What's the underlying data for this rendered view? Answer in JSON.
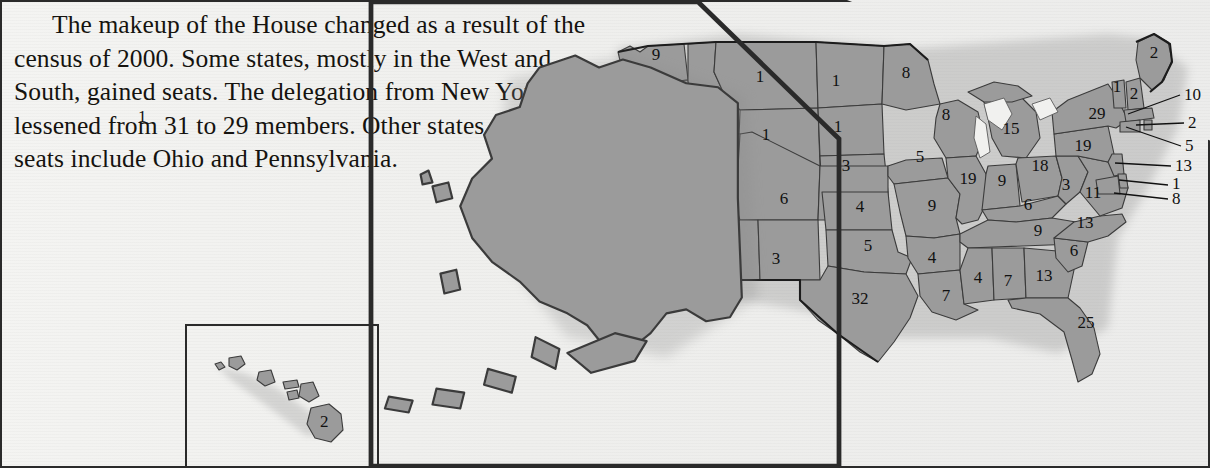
{
  "caption": {
    "text": "The makeup of the House changed as a result of the census of 2000. Some states, mostly in the West and South, gained seats. The delegation from New York lessened from 31 to 29 members. Other states that lost seats include Ohio and Pennsylvania."
  },
  "colors": {
    "land_fill": "#9b9b9b",
    "land_stroke": "#3b3b3b",
    "coast_stroke": "#1c1c1c",
    "page_background": "#f1f1ef",
    "text": "#15130f"
  },
  "map": {
    "title": "U.S. House seats by state after the 2000 census",
    "inset_hawaii_label": "2",
    "inset_alaska_label": "1",
    "ghost_text": "bleed-through",
    "states": [
      {
        "code": "WA",
        "seats": "9",
        "x": 68,
        "y": 52
      },
      {
        "code": "OR",
        "seats": "5",
        "x": 44,
        "y": 98
      },
      {
        "code": "ID",
        "seats": "2",
        "x": 110,
        "y": 113
      },
      {
        "code": "MT",
        "seats": "1",
        "x": 172,
        "y": 74
      },
      {
        "code": "WY",
        "seats": "1",
        "x": 178,
        "y": 132
      },
      {
        "code": "ND",
        "seats": "1",
        "x": 248,
        "y": 78
      },
      {
        "code": "SD",
        "seats": "1",
        "x": 250,
        "y": 124
      },
      {
        "code": "NE",
        "seats": "3",
        "x": 258,
        "y": 163
      },
      {
        "code": "CA",
        "seats": "52",
        "x": 36,
        "y": 199
      },
      {
        "code": "NV",
        "seats": "3",
        "x": 82,
        "y": 172
      },
      {
        "code": "UT",
        "seats": "3",
        "x": 134,
        "y": 185
      },
      {
        "code": "CO",
        "seats": "6",
        "x": 196,
        "y": 196
      },
      {
        "code": "KS",
        "seats": "4",
        "x": 272,
        "y": 204
      },
      {
        "code": "AZ",
        "seats": "8",
        "x": 126,
        "y": 248
      },
      {
        "code": "NM",
        "seats": "3",
        "x": 188,
        "y": 256
      },
      {
        "code": "OK",
        "seats": "5",
        "x": 280,
        "y": 243
      },
      {
        "code": "TX",
        "seats": "32",
        "x": 272,
        "y": 296
      },
      {
        "code": "MN",
        "seats": "8",
        "x": 318,
        "y": 70
      },
      {
        "code": "IA",
        "seats": "5",
        "x": 332,
        "y": 154
      },
      {
        "code": "MO",
        "seats": "9",
        "x": 344,
        "y": 203
      },
      {
        "code": "AR",
        "seats": "4",
        "x": 344,
        "y": 255
      },
      {
        "code": "LA",
        "seats": "7",
        "x": 358,
        "y": 293
      },
      {
        "code": "WI",
        "seats": "8",
        "x": 358,
        "y": 112
      },
      {
        "code": "IL",
        "seats": "19",
        "x": 380,
        "y": 176
      },
      {
        "code": "MI",
        "seats": "15",
        "x": 423,
        "y": 126
      },
      {
        "code": "IN",
        "seats": "9",
        "x": 414,
        "y": 178
      },
      {
        "code": "OH",
        "seats": "18",
        "x": 452,
        "y": 163
      },
      {
        "code": "KY",
        "seats": "6",
        "x": 440,
        "y": 202
      },
      {
        "code": "TN",
        "seats": "9",
        "x": 450,
        "y": 228
      },
      {
        "code": "MS",
        "seats": "4",
        "x": 390,
        "y": 275
      },
      {
        "code": "AL",
        "seats": "7",
        "x": 420,
        "y": 278
      },
      {
        "code": "GA",
        "seats": "13",
        "x": 456,
        "y": 273
      },
      {
        "code": "FL",
        "seats": "25",
        "x": 498,
        "y": 320
      },
      {
        "code": "SC",
        "seats": "6",
        "x": 486,
        "y": 248
      },
      {
        "code": "NC",
        "seats": "13",
        "x": 497,
        "y": 220
      },
      {
        "code": "WV",
        "seats": "3",
        "x": 478,
        "y": 182
      },
      {
        "code": "VA",
        "seats": "11",
        "x": 505,
        "y": 190
      },
      {
        "code": "PA",
        "seats": "19",
        "x": 495,
        "y": 143
      },
      {
        "code": "NY",
        "seats": "29",
        "x": 509,
        "y": 111
      },
      {
        "code": "VT",
        "seats": "1",
        "x": 529,
        "y": 84
      },
      {
        "code": "NH",
        "seats": "2",
        "x": 546,
        "y": 91
      },
      {
        "code": "ME",
        "seats": "2",
        "x": 566,
        "y": 50
      }
    ],
    "callouts": [
      {
        "code": "MA",
        "seats": "10",
        "label_x": 596,
        "label_y": 92,
        "x1": 592,
        "y1": 87,
        "x2": 540,
        "y2": 106
      },
      {
        "code": "RI",
        "seats": "2",
        "label_x": 600,
        "label_y": 120,
        "x1": 596,
        "y1": 115,
        "x2": 548,
        "y2": 117
      },
      {
        "code": "CT",
        "seats": "5",
        "label_x": 597,
        "label_y": 143,
        "x1": 593,
        "y1": 138,
        "x2": 538,
        "y2": 119
      },
      {
        "code": "NJ",
        "seats": "13",
        "label_x": 587,
        "label_y": 163,
        "x1": 583,
        "y1": 158,
        "x2": 527,
        "y2": 155
      },
      {
        "code": "DE",
        "seats": "1",
        "label_x": 584,
        "label_y": 181,
        "x1": 580,
        "y1": 177,
        "x2": 531,
        "y2": 172
      },
      {
        "code": "MD",
        "seats": "8",
        "label_x": 584,
        "label_y": 196,
        "x1": 580,
        "y1": 191,
        "x2": 526,
        "y2": 185
      }
    ]
  }
}
